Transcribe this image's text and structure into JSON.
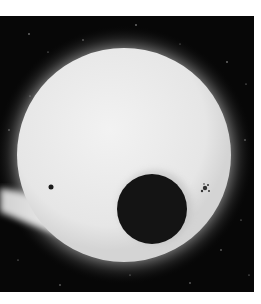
{
  "image": {
    "subject": "Sun disk with dark transiting body and sunspots against starfield",
    "colors": {
      "background": "#ffffff",
      "space": "#070707",
      "disk": "#eeeeee",
      "transit_body": "#141414"
    },
    "alt": "Grayscale photograph of a bright sun-like disk with a dark circular body in front and small sunspots"
  }
}
